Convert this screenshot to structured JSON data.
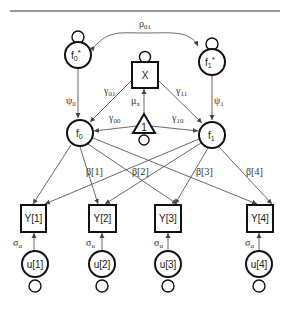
{
  "diagram": {
    "type": "path-diagram",
    "nodes": {
      "f0_star": {
        "label": "f",
        "sub": "0",
        "sup": "*"
      },
      "f1_star": {
        "label": "f",
        "sub": "1",
        "sup": "*"
      },
      "x": {
        "label": "X"
      },
      "f0": {
        "label": "f",
        "sub": "0"
      },
      "f1": {
        "label": "f",
        "sub": "1"
      },
      "constant": {
        "label": "1"
      },
      "y1": {
        "label": "Y[1]"
      },
      "y2": {
        "label": "Y[2]"
      },
      "y3": {
        "label": "Y[3]"
      },
      "y4": {
        "label": "Y[4]"
      },
      "u1": {
        "label": "u[1]"
      },
      "u2": {
        "label": "u[2]"
      },
      "u3": {
        "label": "u[3]"
      },
      "u4": {
        "label": "u[4]"
      }
    },
    "edge_labels": {
      "rho01": {
        "sym": "ρ",
        "sub": "01"
      },
      "psi0": {
        "sym": "ψ",
        "sub": "0"
      },
      "psi1": {
        "sym": "ψ",
        "sub": "1"
      },
      "gamma01": {
        "sym": "γ",
        "sub": "01"
      },
      "gamma11": {
        "sym": "γ",
        "sub": "11"
      },
      "gamma00": {
        "sym": "γ",
        "sub": "00"
      },
      "gamma10": {
        "sym": "γ",
        "sub": "10"
      },
      "mux": {
        "sym": "μ",
        "sub": "x"
      },
      "beta1": "β[1]",
      "beta2": "β[2]",
      "beta3": "β[3]",
      "beta4": "β[4]",
      "sigma_u1": {
        "sym": "σ",
        "sub": "u"
      },
      "sigma_u2": {
        "sym": "σ",
        "sub": "u"
      },
      "sigma_u3": {
        "sym": "σ",
        "sub": "u"
      },
      "sigma_u4": {
        "sym": "σ",
        "sub": "u"
      }
    }
  }
}
